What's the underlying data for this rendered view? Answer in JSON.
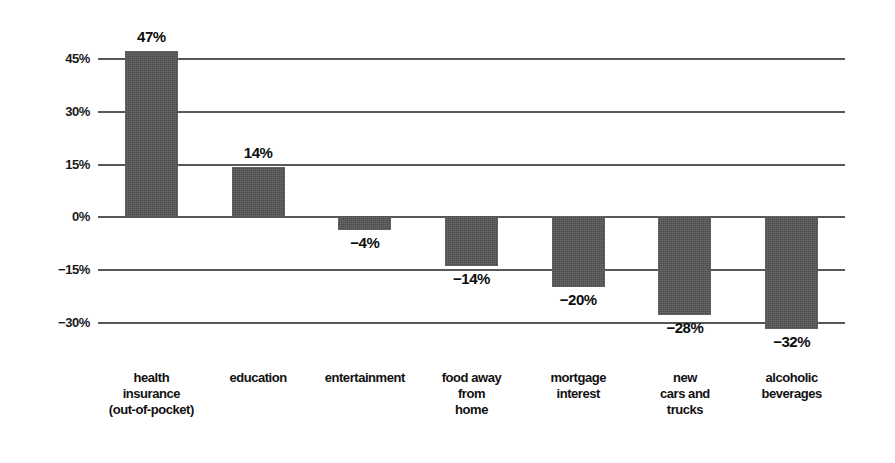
{
  "chart_data": {
    "type": "bar",
    "title": "",
    "subtitle": "",
    "xlabel": "",
    "ylabel": "",
    "orientation": "vertical",
    "grid": true,
    "legend": null,
    "ylim": [
      -30,
      45
    ],
    "yticks": [
      45,
      30,
      15,
      0,
      -15,
      -30
    ],
    "ytick_labels": [
      "45%",
      "30%",
      "15%",
      "0%",
      "−15%",
      "−30%"
    ],
    "categories": [
      "health\ninsurance\n(out-of-pocket)",
      "education",
      "entertainment",
      "food away\nfrom\nhome",
      "mortgage\ninterest",
      "new\ncars and\ntrucks",
      "alcoholic\nbeverages"
    ],
    "values": [
      47,
      14,
      -4,
      -14,
      -20,
      -28,
      -32
    ],
    "value_labels": [
      "47%",
      "14%",
      "−4%",
      "−14%",
      "−20%",
      "−28%",
      "−32%"
    ],
    "bar_color": "#4d4d4f",
    "grid_color": "#58585a",
    "text_color": "#111111",
    "background_color": "#ffffff"
  }
}
